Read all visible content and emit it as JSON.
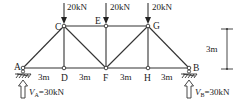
{
  "diagram": {
    "type": "truss",
    "nodes": [
      {
        "id": "A",
        "label": "A",
        "x": 23,
        "y": 68
      },
      {
        "id": "D",
        "label": "D",
        "x": 64,
        "y": 68
      },
      {
        "id": "F",
        "label": "F",
        "x": 106,
        "y": 68
      },
      {
        "id": "H",
        "label": "H",
        "x": 148,
        "y": 68
      },
      {
        "id": "B",
        "label": "B",
        "x": 189,
        "y": 68
      },
      {
        "id": "C",
        "label": "C",
        "x": 64,
        "y": 26
      },
      {
        "id": "E",
        "label": "E",
        "x": 106,
        "y": 26
      },
      {
        "id": "G",
        "label": "G",
        "x": 148,
        "y": 26
      }
    ],
    "members": [
      [
        "A",
        "D"
      ],
      [
        "D",
        "F"
      ],
      [
        "F",
        "H"
      ],
      [
        "H",
        "B"
      ],
      [
        "C",
        "E"
      ],
      [
        "E",
        "G"
      ],
      [
        "A",
        "C"
      ],
      [
        "C",
        "D"
      ],
      [
        "C",
        "F"
      ],
      [
        "E",
        "F"
      ],
      [
        "F",
        "G"
      ],
      [
        "G",
        "H"
      ],
      [
        "G",
        "B"
      ]
    ],
    "loads": [
      {
        "node": "C",
        "label": "20kN"
      },
      {
        "node": "E",
        "label": "20kN"
      },
      {
        "node": "G",
        "label": "20kN"
      }
    ],
    "spans": [
      {
        "label": "3m"
      },
      {
        "label": "3m"
      },
      {
        "label": "3m"
      },
      {
        "label": "3m"
      }
    ],
    "height_dimension": {
      "label": "3m"
    },
    "reactions": [
      {
        "node": "A",
        "symbol": "V",
        "subscript": "A",
        "value": "=30kN"
      },
      {
        "node": "B",
        "symbol": "V",
        "subscript": "B",
        "value": "=30kN"
      }
    ]
  }
}
